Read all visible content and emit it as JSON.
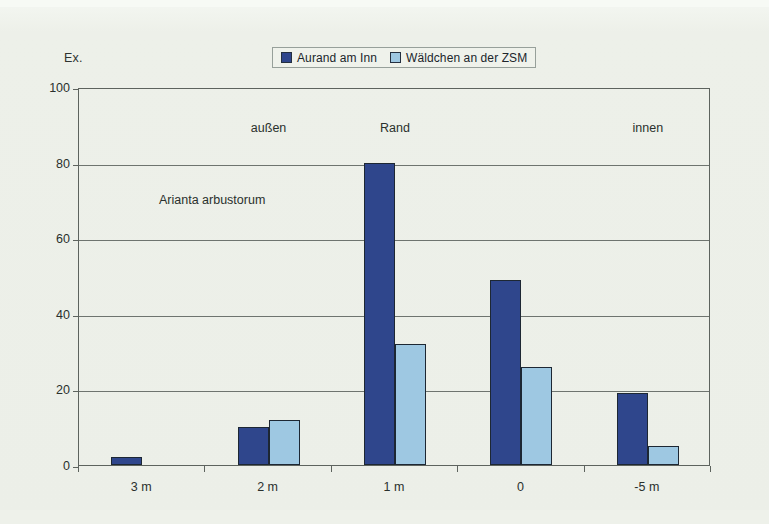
{
  "figure": {
    "background_color": "#eef1ea",
    "plot_border_color": "#5d635e"
  },
  "legend": {
    "position": "top-center",
    "entries": [
      {
        "label": "Aurand am Inn",
        "color": "#2f468c",
        "swatch_name": "legend-swatch-dark-blue"
      },
      {
        "label": "Wäldchen an der ZSM",
        "color": "#9ec8e2",
        "swatch_name": "legend-swatch-light-blue"
      }
    ]
  },
  "annotations": {
    "zones": [
      {
        "text": "außen",
        "x_category": "2 m"
      },
      {
        "text": "Rand",
        "x_category": "1 m"
      },
      {
        "text": "innen",
        "x_category": "-5 m"
      }
    ],
    "species": "Arianta arbustorum"
  },
  "chart_data": {
    "type": "bar",
    "title": "",
    "subtitle": "",
    "xlabel": "",
    "ylabel": "Ex.",
    "ylim": [
      0,
      100
    ],
    "yticks": [
      0,
      20,
      40,
      60,
      80,
      100
    ],
    "grid": true,
    "legend_position": "top-center",
    "categories": [
      "3 m",
      "2 m",
      "1 m",
      "0",
      "-5 m"
    ],
    "series": [
      {
        "name": "Aurand am Inn",
        "color": "#2f468c",
        "values": [
          2,
          10,
          80,
          49,
          19
        ]
      },
      {
        "name": "Wäldchen an der ZSM",
        "color": "#9ec8e2",
        "values": [
          0,
          12,
          32,
          26,
          5
        ]
      }
    ]
  }
}
